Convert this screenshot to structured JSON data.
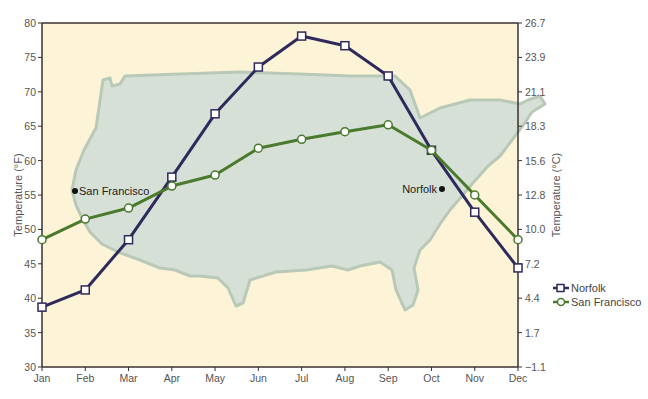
{
  "chart_data": {
    "type": "line",
    "title": "",
    "xlabel": "",
    "ylabel": "Temperature (°F)",
    "ylabel_right": "Temperature (°C)",
    "ylim": [
      30,
      80
    ],
    "categories": [
      "Jan",
      "Feb",
      "Mar",
      "Apr",
      "May",
      "Jun",
      "Jul",
      "Aug",
      "Sep",
      "Oct",
      "Nov",
      "Dec"
    ],
    "y_ticks_left": [
      30,
      35,
      40,
      45,
      50,
      55,
      60,
      65,
      70,
      75,
      80
    ],
    "y_ticks_right": [
      "-1.1",
      "1.7",
      "4.4",
      "7.2",
      "10.0",
      "12.8",
      "15.6",
      "18.3",
      "21.1",
      "23.9",
      "26.7"
    ],
    "grid": false,
    "legend_position": "right",
    "series": [
      {
        "name": "Norfolk",
        "marker": "square",
        "color": "#2e2a5c",
        "values": [
          38.7,
          41.2,
          48.5,
          57.6,
          66.8,
          73.6,
          78.1,
          76.7,
          72.3,
          61.5,
          52.5,
          44.4
        ]
      },
      {
        "name": "San Francisco",
        "marker": "circle",
        "color": "#4a7a2e",
        "values": [
          48.5,
          51.5,
          53.1,
          56.3,
          57.9,
          61.8,
          63.1,
          64.2,
          65.2,
          61.5,
          55.0,
          48.5
        ]
      }
    ],
    "annotations": [
      {
        "text": "San Francisco",
        "dot_x": 75,
        "dot_y": 191,
        "side": "right"
      },
      {
        "text": "Norfolk",
        "dot_x": 442,
        "dot_y": 189,
        "side": "left"
      }
    ]
  },
  "colors": {
    "plot_background": "#fdf3d6",
    "map_fill": "#d7e0d6",
    "map_stroke": "#b9c9b8",
    "axis": "#3a3030",
    "text": "#555555"
  }
}
